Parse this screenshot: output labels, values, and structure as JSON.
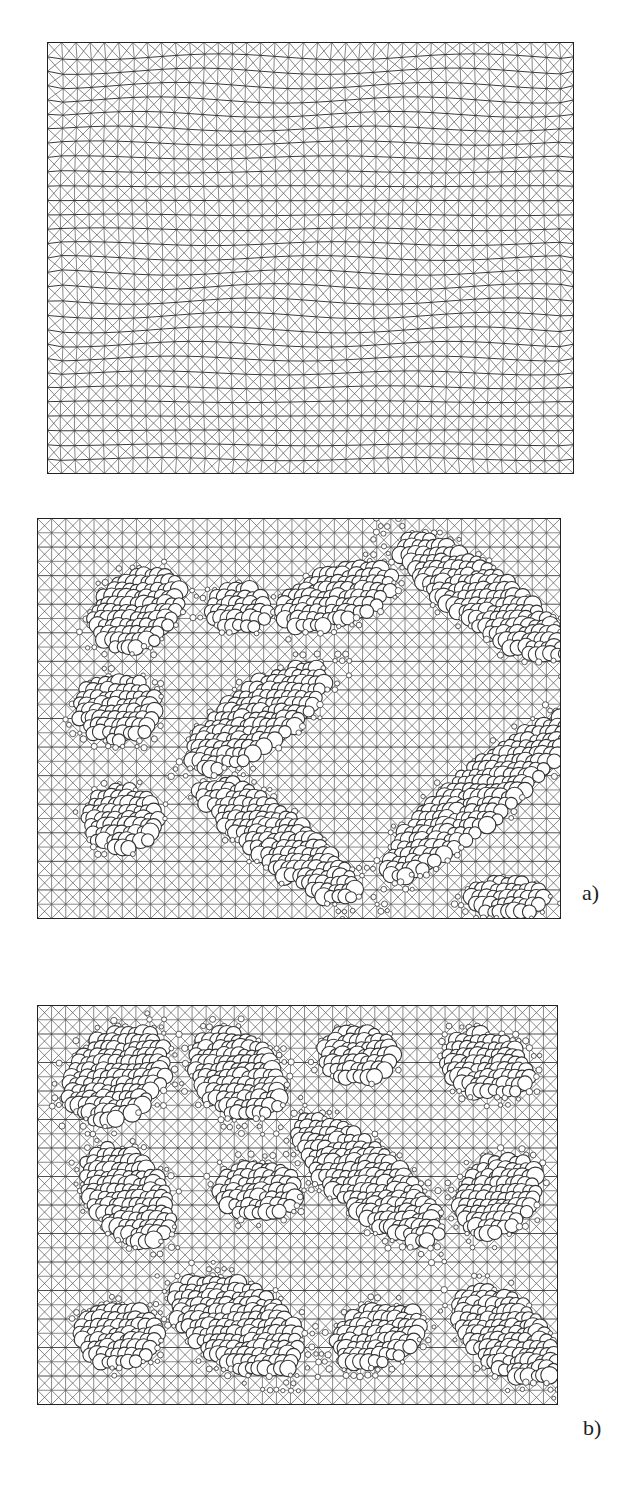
{
  "figure": {
    "panels": [
      {
        "id": "top",
        "description": "Triangulated rectangular mesh with wavy distortion",
        "box": {
          "x": 47,
          "y": 42,
          "w": 526,
          "h": 431
        },
        "cols": 37,
        "rows": 30,
        "wave": 1,
        "clusters": []
      },
      {
        "id": "a",
        "label": "a)",
        "label_pos": {
          "x": 582,
          "y": 892
        },
        "description": "Mesh with circular particle inclusions arranged in a ring of elongated clusters",
        "box": {
          "x": 37,
          "y": 518,
          "w": 523,
          "h": 400
        },
        "cols": 37,
        "rows": 28,
        "wave": 0,
        "clusters": [
          {
            "cx": 100,
            "cy": 92,
            "rx": 48,
            "ry": 34,
            "angle": -30
          },
          {
            "cx": 200,
            "cy": 90,
            "rx": 30,
            "ry": 22,
            "angle": 0
          },
          {
            "cx": 300,
            "cy": 78,
            "rx": 60,
            "ry": 26,
            "angle": -20
          },
          {
            "cx": 445,
            "cy": 80,
            "rx": 100,
            "ry": 28,
            "angle": 35
          },
          {
            "cx": 80,
            "cy": 190,
            "rx": 40,
            "ry": 32,
            "angle": 0
          },
          {
            "cx": 220,
            "cy": 200,
            "rx": 80,
            "ry": 30,
            "angle": -35
          },
          {
            "cx": 85,
            "cy": 300,
            "rx": 38,
            "ry": 30,
            "angle": 0
          },
          {
            "cx": 240,
            "cy": 320,
            "rx": 100,
            "ry": 26,
            "angle": 38
          },
          {
            "cx": 440,
            "cy": 280,
            "rx": 120,
            "ry": 28,
            "angle": -40
          },
          {
            "cx": 470,
            "cy": 380,
            "rx": 40,
            "ry": 18,
            "angle": 0
          }
        ]
      },
      {
        "id": "b",
        "label": "b)",
        "label_pos": {
          "x": 583,
          "y": 1427
        },
        "description": "Mesh with circular particle inclusions in diagonal elongated clusters",
        "box": {
          "x": 37,
          "y": 1005,
          "w": 520,
          "h": 399
        },
        "cols": 37,
        "rows": 28,
        "wave": 0,
        "clusters": [
          {
            "cx": 80,
            "cy": 70,
            "rx": 55,
            "ry": 40,
            "angle": -40
          },
          {
            "cx": 200,
            "cy": 70,
            "rx": 50,
            "ry": 38,
            "angle": 40
          },
          {
            "cx": 320,
            "cy": 50,
            "rx": 35,
            "ry": 25,
            "angle": 0
          },
          {
            "cx": 450,
            "cy": 60,
            "rx": 45,
            "ry": 30,
            "angle": 20
          },
          {
            "cx": 90,
            "cy": 190,
            "rx": 55,
            "ry": 35,
            "angle": 50
          },
          {
            "cx": 220,
            "cy": 185,
            "rx": 40,
            "ry": 28,
            "angle": 0
          },
          {
            "cx": 330,
            "cy": 175,
            "rx": 90,
            "ry": 32,
            "angle": 40
          },
          {
            "cx": 460,
            "cy": 190,
            "rx": 45,
            "ry": 34,
            "angle": -40
          },
          {
            "cx": 80,
            "cy": 330,
            "rx": 40,
            "ry": 30,
            "angle": 0
          },
          {
            "cx": 200,
            "cy": 320,
            "rx": 70,
            "ry": 40,
            "angle": 30
          },
          {
            "cx": 340,
            "cy": 330,
            "rx": 45,
            "ry": 28,
            "angle": -20
          },
          {
            "cx": 470,
            "cy": 330,
            "rx": 60,
            "ry": 34,
            "angle": 40
          }
        ]
      }
    ],
    "style": {
      "line_color": "#555555",
      "strong_line_color": "#222222",
      "circle_stroke": "#333333",
      "circle_fill": "#ffffff",
      "background": "#ffffff"
    }
  }
}
